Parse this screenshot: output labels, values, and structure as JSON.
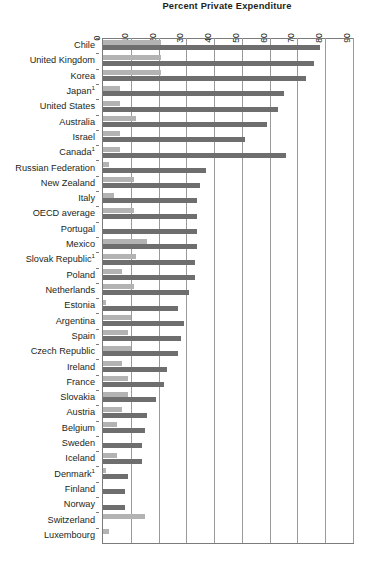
{
  "chart_data": {
    "type": "bar",
    "orientation": "horizontal",
    "title": "Percent Private Expenditure",
    "xlabel": "",
    "ylabel": "",
    "xlim": [
      0,
      90
    ],
    "xticks": [
      0,
      10,
      20,
      30,
      40,
      50,
      60,
      70,
      80,
      90
    ],
    "xtick_labels": [
      "0",
      "10",
      "20",
      "30",
      "40",
      "50",
      "60",
      "70",
      "80",
      "90"
    ],
    "grid": true,
    "legend": null,
    "colors": {
      "light_series": "#b3b3b3",
      "dark_series": "#6e6e6e",
      "axis": "#7b7b7b",
      "grid": "#9a9a9a",
      "text": "#231f20",
      "background": "#ffffff"
    },
    "categories": [
      "Chile",
      "United Kingdom",
      "Korea",
      "Japan¹",
      "United States",
      "Australia",
      "Israel",
      "Canada¹",
      "Russian Federation",
      "New Zealand",
      "Italy",
      "OECD average",
      "Portugal",
      "Mexico",
      "Slovak Republic¹",
      "Poland",
      "Netherlands",
      "Estonia",
      "Argentina",
      "Spain",
      "Czech Republic",
      "Ireland",
      "France",
      "Slovakia",
      "Austria",
      "Belgium",
      "Sweden",
      "Iceland",
      "Denmark¹",
      "Finland",
      "Norway",
      "Switzerland",
      "Luxembourg"
    ],
    "series": [
      {
        "name": "light",
        "values": [
          21,
          21,
          21,
          6,
          6,
          12,
          6,
          6,
          2,
          11,
          4,
          11,
          0,
          16,
          12,
          7,
          11,
          1,
          10,
          9,
          10,
          7,
          9,
          9,
          7,
          5,
          0,
          5,
          1,
          0,
          0,
          15,
          2
        ]
      },
      {
        "name": "dark",
        "values": [
          78,
          76,
          73,
          65,
          63,
          59,
          51,
          66,
          37,
          35,
          34,
          34,
          34,
          34,
          33,
          33,
          31,
          27,
          29,
          28,
          27,
          23,
          22,
          19,
          16,
          15,
          14,
          14,
          9,
          8,
          8,
          0,
          0
        ]
      }
    ]
  }
}
